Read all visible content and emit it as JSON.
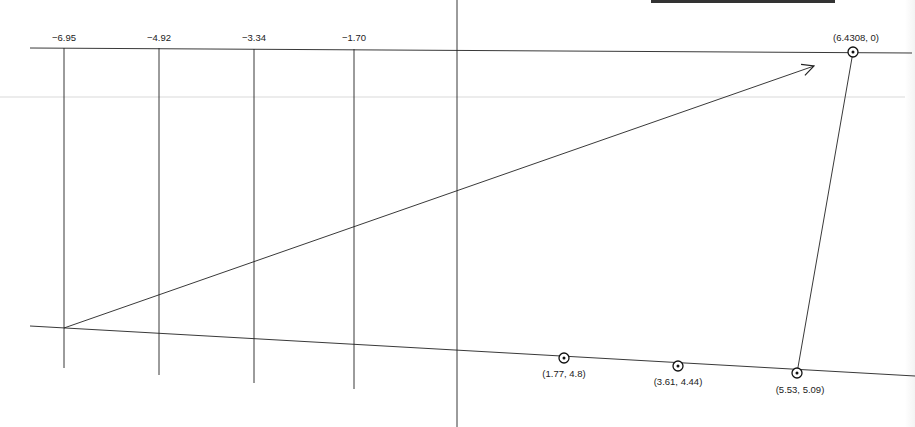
{
  "diagram": {
    "type": "geometric-construction",
    "top_labels": [
      {
        "text": "−6.95",
        "x": 64
      },
      {
        "text": "−4.92",
        "x": 159
      },
      {
        "text": "−3.34",
        "x": 254
      },
      {
        "text": "−1.70",
        "x": 354
      }
    ],
    "points": [
      {
        "label": "(6.4308, 0)",
        "x": 853,
        "y": 52,
        "label_x": 856,
        "label_y": 33
      },
      {
        "label": "(1.77, 4.8)",
        "x": 564,
        "y": 358,
        "label_x": 564,
        "label_y": 372
      },
      {
        "label": "(3.61, 4.44)",
        "x": 678,
        "y": 366,
        "label_x": 678,
        "label_y": 380
      },
      {
        "label": "(5.53, 5.09)",
        "x": 797,
        "y": 373,
        "label_x": 800,
        "label_y": 388
      }
    ]
  }
}
